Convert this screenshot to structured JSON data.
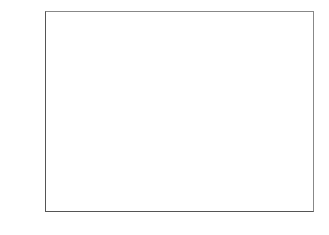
{
  "chart_data": {
    "type": "bar",
    "title": "",
    "xlabel": "",
    "ylabel": "Percentage of Cases",
    "categories": [
      "No",
      "Undecided",
      "Yes"
    ],
    "values": [
      35,
      25,
      40
    ],
    "data_labels": [
      "35",
      "25",
      "40"
    ],
    "ylim": [
      0,
      45
    ],
    "yticks": [
      0,
      5,
      10,
      15,
      20,
      25,
      30,
      35,
      40,
      45
    ],
    "grid": false,
    "legend": "none",
    "bar_color": "#4a4a4a"
  }
}
